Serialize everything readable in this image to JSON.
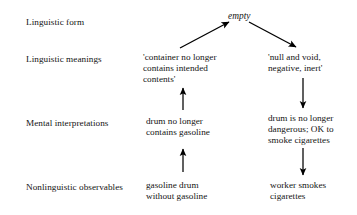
{
  "figure": {
    "type": "diagram",
    "kind": "flow-diagram",
    "background_color": "#ffffff",
    "text_color": "#141414",
    "arrow_color": "#000000",
    "top_cut_text": ""
  },
  "row_labels": [
    {
      "id": "linguistic-form",
      "label": "Linguistic form"
    },
    {
      "id": "linguistic-meanings",
      "label": "Linguistic meanings"
    },
    {
      "id": "mental-interpretations",
      "label": "Mental interpretations"
    },
    {
      "id": "nonlinguistic-observables",
      "label": "Nonlinguistic observables"
    }
  ],
  "nodes": {
    "empty": {
      "text": "empty",
      "style": "italic"
    },
    "meaning_left": {
      "lines": [
        "'container no longer",
        "contains intended",
        "contents'"
      ]
    },
    "meaning_right": {
      "lines": [
        "'null and void,",
        "negative, inert'"
      ]
    },
    "mental_left": {
      "lines": [
        "drum no longer",
        "contains gasoline"
      ]
    },
    "mental_right": {
      "lines": [
        "drum is no longer",
        "dangerous; OK to",
        "smoke cigarettes"
      ]
    },
    "observable_left": {
      "lines": [
        "gasoline drum",
        "without gasoline"
      ]
    },
    "observable_right": {
      "lines": [
        "worker smokes",
        "cigarettes"
      ]
    }
  },
  "arrows": [
    {
      "id": "observable-left-to-mental-left",
      "direction": "up",
      "from": "gasoline drum without gasoline",
      "to": "drum no longer contains gasoline"
    },
    {
      "id": "mental-left-to-meaning-left",
      "direction": "up",
      "from": "drum no longer contains gasoline",
      "to": "'container no longer contains intended contents'"
    },
    {
      "id": "meaning-left-to-empty",
      "direction": "up-right",
      "from": "'container no longer contains intended contents'",
      "to": "empty"
    },
    {
      "id": "empty-to-meaning-right",
      "direction": "down-right",
      "from": "empty",
      "to": "'null and void, negative, inert'"
    },
    {
      "id": "meaning-right-to-mental-right",
      "direction": "down",
      "from": "'null and void, negative, inert'",
      "to": "drum is no longer dangerous; OK to smoke cigarettes"
    },
    {
      "id": "mental-right-to-observable-right",
      "direction": "down",
      "from": "drum is no longer dangerous; OK to smoke cigarettes",
      "to": "worker smokes cigarettes"
    }
  ]
}
